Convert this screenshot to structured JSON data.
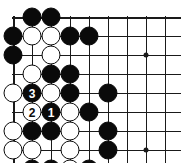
{
  "diagram": {
    "type": "go-board-diagram",
    "board_region": "upper-left corner",
    "grid": {
      "columns": 9,
      "rows": 8,
      "spacing_px": 19,
      "origin_x": 13,
      "origin_y": 17,
      "line_color": "#1a1a1a",
      "background_color": "#ffffff",
      "top_edge_row": 1,
      "left_edge_column": 1
    },
    "star_points": [
      {
        "col": 8,
        "row": 3
      },
      {
        "col": 8,
        "row": 8
      }
    ],
    "stones": [
      {
        "col": 2,
        "row": 1,
        "color": "black"
      },
      {
        "col": 3,
        "row": 1,
        "color": "black"
      },
      {
        "col": 1,
        "row": 2,
        "color": "black"
      },
      {
        "col": 2,
        "row": 2,
        "color": "white"
      },
      {
        "col": 3,
        "row": 2,
        "color": "white"
      },
      {
        "col": 4,
        "row": 2,
        "color": "black"
      },
      {
        "col": 5,
        "row": 2,
        "color": "black"
      },
      {
        "col": 1,
        "row": 3,
        "color": "black"
      },
      {
        "col": 3,
        "row": 3,
        "color": "white"
      },
      {
        "col": 2,
        "row": 4,
        "color": "white"
      },
      {
        "col": 3,
        "row": 4,
        "color": "black"
      },
      {
        "col": 4,
        "row": 4,
        "color": "black"
      },
      {
        "col": 1,
        "row": 5,
        "color": "white"
      },
      {
        "col": 2,
        "row": 5,
        "color": "black",
        "number": "3"
      },
      {
        "col": 3,
        "row": 5,
        "color": "white"
      },
      {
        "col": 4,
        "row": 5,
        "color": "black"
      },
      {
        "col": 6,
        "row": 5,
        "color": "black"
      },
      {
        "col": 2,
        "row": 6,
        "color": "white",
        "number": "2"
      },
      {
        "col": 3,
        "row": 6,
        "color": "black",
        "number": "1"
      },
      {
        "col": 4,
        "row": 6,
        "color": "white"
      },
      {
        "col": 5,
        "row": 6,
        "color": "black"
      },
      {
        "col": 1,
        "row": 7,
        "color": "white"
      },
      {
        "col": 2,
        "row": 7,
        "color": "black"
      },
      {
        "col": 3,
        "row": 7,
        "color": "black"
      },
      {
        "col": 4,
        "row": 7,
        "color": "white"
      },
      {
        "col": 6,
        "row": 7,
        "color": "black"
      },
      {
        "col": 1,
        "row": 8,
        "color": "white"
      },
      {
        "col": 2,
        "row": 8,
        "color": "white"
      },
      {
        "col": 4,
        "row": 8,
        "color": "white"
      },
      {
        "col": 6,
        "row": 8,
        "color": "black"
      },
      {
        "col": 2,
        "row": 9,
        "color": "black"
      },
      {
        "col": 3,
        "row": 9,
        "color": "black"
      },
      {
        "col": 4,
        "row": 9,
        "color": "white"
      },
      {
        "col": 5,
        "row": 9,
        "color": "black"
      },
      {
        "col": 2,
        "row": 10,
        "color": "black"
      },
      {
        "col": 3,
        "row": 10,
        "color": "black"
      },
      {
        "col": 4,
        "row": 10,
        "color": "black"
      }
    ],
    "move_markers": [
      {
        "number": "1",
        "color": "black",
        "col": 3,
        "row": 6
      },
      {
        "number": "2",
        "color": "white",
        "col": 2,
        "row": 6
      },
      {
        "number": "3",
        "color": "black",
        "col": 2,
        "row": 5
      }
    ]
  }
}
